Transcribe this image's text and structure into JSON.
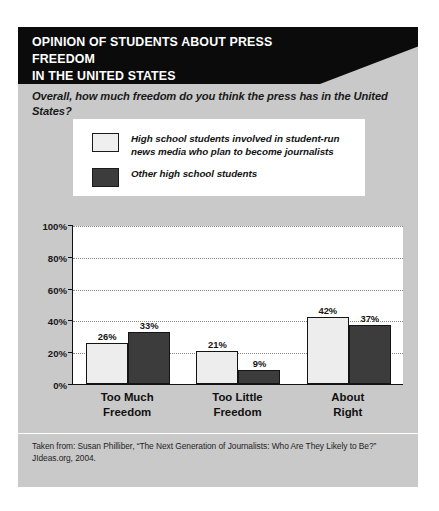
{
  "header": {
    "title_line1": "OPINION OF STUDENTS ABOUT PRESS FREEDOM",
    "title_line2": "IN THE UNITED STATES",
    "background_color": "#0b0b0b",
    "text_color": "#ffffff"
  },
  "question": "Overall, how much freedom do you think the press has in the United States?",
  "legend": {
    "items": [
      {
        "label": "High school students involved in student-run\nnews media who plan to become journalists",
        "swatch": "light",
        "color": "#efefef"
      },
      {
        "label": "Other high school students",
        "swatch": "dark",
        "color": "#3c3c3c"
      }
    ]
  },
  "source": "Taken from: Susan Philliber, “The Next Generation of Journalists: Who Are They Likely to Be?” JIdeas.org, 2004.",
  "card": {
    "background_color": "#c9c9c9"
  },
  "chart_data": {
    "type": "bar",
    "title": "OPINION OF STUDENTS ABOUT PRESS FREEDOM IN THE UNITED STATES",
    "subtitle": "Overall, how much freedom do you think the press has in the United States?",
    "categories": [
      "Too Much\nFreedom",
      "Too Little\nFreedom",
      "About\nRight"
    ],
    "series": [
      {
        "name": "High school students involved in student-run news media who plan to become journalists",
        "color": "#efefef",
        "values": [
          26,
          21,
          42
        ],
        "value_labels": [
          "26%",
          "21%",
          "42%"
        ]
      },
      {
        "name": "Other high school students",
        "color": "#3c3c3c",
        "values": [
          33,
          9,
          37
        ],
        "value_labels": [
          "33%",
          "9%",
          "37%"
        ]
      }
    ],
    "xlabel": "",
    "ylabel": "",
    "ylim": [
      0,
      100
    ],
    "yticks": [
      0,
      20,
      40,
      60,
      80,
      100
    ],
    "ytick_labels": [
      "0%",
      "20%",
      "40%",
      "60%",
      "80%",
      "100%"
    ],
    "grid": true,
    "legend_position": "top"
  }
}
